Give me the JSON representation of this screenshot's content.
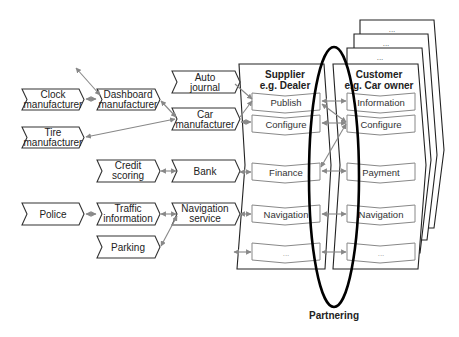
{
  "diagram": {
    "partners": [
      {
        "id": "clock",
        "lines": [
          "Clock",
          "manufacturer"
        ]
      },
      {
        "id": "tire",
        "lines": [
          "Tire",
          "manufacturer"
        ]
      },
      {
        "id": "dashboard",
        "lines": [
          "Dashboard",
          "manufacturer"
        ]
      },
      {
        "id": "auto-journal",
        "lines": [
          "Auto",
          "journal"
        ]
      },
      {
        "id": "car",
        "lines": [
          "Car",
          "manufacturer"
        ]
      },
      {
        "id": "credit",
        "lines": [
          "Credit",
          "scoring"
        ]
      },
      {
        "id": "bank",
        "lines": [
          "Bank"
        ]
      },
      {
        "id": "police",
        "lines": [
          "Police"
        ]
      },
      {
        "id": "traffic",
        "lines": [
          "Traffic",
          "information"
        ]
      },
      {
        "id": "navigation-service",
        "lines": [
          "Navigation",
          "service"
        ]
      },
      {
        "id": "parking",
        "lines": [
          "Parking"
        ]
      }
    ],
    "supplier": {
      "title_line1": "Supplier",
      "title_line2": "e.g. Dealer",
      "processes": [
        "Publish",
        "Configure",
        "Finance",
        "Navigation",
        "..."
      ]
    },
    "customer": {
      "title_line1": "Customer",
      "title_line2": "e.g. Car owner",
      "processes": [
        "Information",
        "Configure",
        "Payment",
        "Navigation",
        "..."
      ],
      "stack_labels": [
        "...",
        "...",
        "..."
      ]
    },
    "ellipse_label": "Partnering"
  }
}
